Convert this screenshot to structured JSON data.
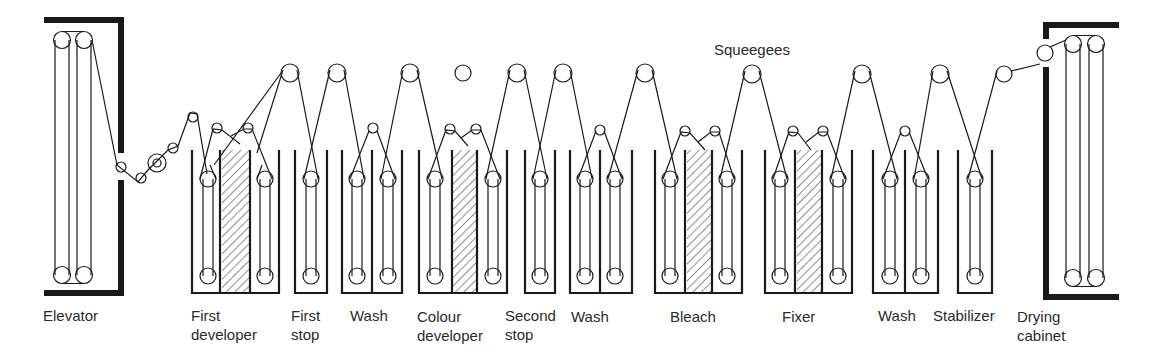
{
  "colors": {
    "ink": "#1a1a1a",
    "background": "#ffffff",
    "hatch": "#333333"
  },
  "labels": {
    "squeegees": "Squeegees",
    "elevator": "Elevator",
    "first_developer": [
      "First",
      "developer"
    ],
    "first_stop": [
      "First",
      "stop"
    ],
    "wash_1": "Wash",
    "colour_developer": [
      "Colour",
      "developer"
    ],
    "second_stop": [
      "Second",
      "stop"
    ],
    "wash_2": "Wash",
    "bleach": "Bleach",
    "fixer": "Fixer",
    "wash_3": "Wash",
    "stabilizer": "Stabilizer",
    "drying_cabinet": [
      "Drying",
      "cabinet"
    ]
  },
  "stages": [
    {
      "id": "elevator",
      "type": "cabinet"
    },
    {
      "id": "first_developer",
      "type": "tank",
      "x": [
        192,
        279
      ],
      "partitions": [
        220,
        250
      ],
      "hatch": [
        222,
        250
      ],
      "racks": [
        208,
        265
      ]
    },
    {
      "id": "first_stop",
      "type": "tank",
      "x": [
        295,
        327
      ],
      "partitions": [],
      "racks": [
        311
      ]
    },
    {
      "id": "wash_1",
      "type": "tank",
      "x": [
        342,
        402
      ],
      "partitions": [
        372
      ],
      "racks": [
        357,
        388
      ]
    },
    {
      "id": "colour_developer",
      "type": "tank",
      "x": [
        419,
        507
      ],
      "partitions": [
        452,
        477
      ],
      "hatch": [
        452,
        477
      ],
      "racks": [
        435,
        493
      ]
    },
    {
      "id": "second_stop",
      "type": "tank",
      "x": [
        525,
        555
      ],
      "partitions": [],
      "racks": [
        540
      ]
    },
    {
      "id": "wash_2",
      "type": "tank",
      "x": [
        570,
        632
      ],
      "partitions": [
        600
      ],
      "racks": [
        585,
        615
      ]
    },
    {
      "id": "bleach",
      "type": "tank",
      "x": [
        655,
        742
      ],
      "partitions": [
        685,
        712
      ],
      "hatch": [
        687,
        712
      ],
      "racks": [
        670,
        727
      ]
    },
    {
      "id": "fixer",
      "type": "tank",
      "x": [
        765,
        852
      ],
      "partitions": [
        795,
        822
      ],
      "hatch": [
        797,
        822
      ],
      "racks": [
        780,
        838
      ]
    },
    {
      "id": "wash_3",
      "type": "tank",
      "x": [
        873,
        938
      ],
      "partitions": [
        905
      ],
      "racks": [
        890,
        921
      ]
    },
    {
      "id": "stabilizer",
      "type": "tank",
      "x": [
        958,
        992
      ],
      "partitions": [],
      "racks": [
        975
      ]
    },
    {
      "id": "drying_cabinet",
      "type": "cabinet"
    }
  ]
}
